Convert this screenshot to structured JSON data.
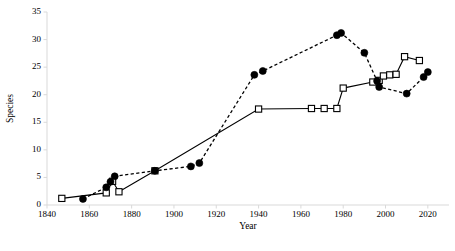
{
  "chart_data": {
    "type": "line",
    "title": "",
    "xlabel": "Year",
    "ylabel": "Species",
    "xlim": [
      1840,
      2030
    ],
    "ylim": [
      0,
      35
    ],
    "xticks": [
      1840,
      1860,
      1880,
      1900,
      1920,
      1940,
      1960,
      1980,
      2000,
      2020
    ],
    "yticks": [
      0,
      5,
      10,
      15,
      20,
      25,
      30,
      35
    ],
    "grid": false,
    "legend": "none",
    "series": [
      {
        "name": "open-square-series",
        "marker": "open-square",
        "line": "solid",
        "color": "#000000",
        "points": [
          {
            "x": 1847,
            "y": 1.2
          },
          {
            "x": 1868,
            "y": 2.2
          },
          {
            "x": 1871,
            "y": 4.3
          },
          {
            "x": 1874,
            "y": 2.4
          },
          {
            "x": 1891,
            "y": 6.2
          },
          {
            "x": 1940,
            "y": 17.4
          },
          {
            "x": 1965,
            "y": 17.5
          },
          {
            "x": 1971,
            "y": 17.5
          },
          {
            "x": 1977,
            "y": 17.5
          },
          {
            "x": 1980,
            "y": 21.2
          },
          {
            "x": 1994,
            "y": 22.3
          },
          {
            "x": 1997,
            "y": 22.6
          },
          {
            "x": 1999,
            "y": 23.4
          },
          {
            "x": 2002,
            "y": 23.6
          },
          {
            "x": 2005,
            "y": 23.7
          },
          {
            "x": 2009,
            "y": 26.9
          },
          {
            "x": 2016,
            "y": 26.2
          }
        ]
      },
      {
        "name": "filled-circle-series",
        "marker": "filled-circle",
        "line": "dashed",
        "color": "#000000",
        "points": [
          {
            "x": 1857,
            "y": 1.1
          },
          {
            "x": 1868,
            "y": 3.2
          },
          {
            "x": 1870,
            "y": 4.2
          },
          {
            "x": 1872,
            "y": 5.2
          },
          {
            "x": 1891,
            "y": 6.2
          },
          {
            "x": 1908,
            "y": 7.0
          },
          {
            "x": 1912,
            "y": 7.6
          },
          {
            "x": 1938,
            "y": 23.6
          },
          {
            "x": 1942,
            "y": 24.3
          },
          {
            "x": 1977,
            "y": 30.8
          },
          {
            "x": 1979,
            "y": 31.2
          },
          {
            "x": 1990,
            "y": 27.6
          },
          {
            "x": 1996,
            "y": 22.5
          },
          {
            "x": 1997,
            "y": 21.4
          },
          {
            "x": 2010,
            "y": 20.2
          },
          {
            "x": 2018,
            "y": 23.2
          },
          {
            "x": 2020,
            "y": 24.1
          }
        ]
      }
    ]
  }
}
